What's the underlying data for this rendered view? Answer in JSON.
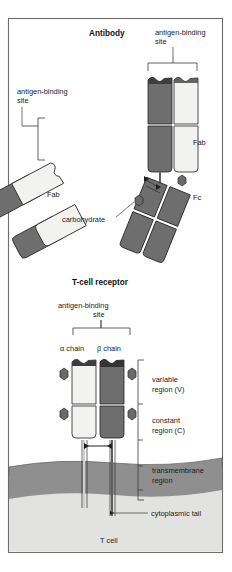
{
  "figure": {
    "title_antibody": "Antibody",
    "title_tcr": "T-cell receptor",
    "labels": {
      "antigen_binding_site_top": "antigen-binding",
      "antigen_binding_site_top2": "site",
      "antigen_binding_site_left": "antigen-binding",
      "antigen_binding_site_left2": "site",
      "antigen_binding_site_tcr": "antigen-binding",
      "antigen_binding_site_tcr2": "site",
      "fab_right": "Fab",
      "fab_left": "Fab",
      "fc": "Fc",
      "carbohydrate": "carbohydrate",
      "alpha_chain": "α chain",
      "beta_chain": "β chain",
      "variable_region": "variable",
      "variable_region2": "region (V)",
      "constant_region": "constant",
      "constant_region2": "region (C)",
      "transmembrane": "transmembrane",
      "transmembrane2": "region",
      "cytoplasmic_tail": "cytoplasmic tail",
      "t_cell": "T cell"
    },
    "colors": {
      "heavy_chain": "#6e6e6e",
      "light_chain": "#f2f2f0",
      "carbohydrate_bead": "#6a6a6a",
      "membrane": "#8f8f8f",
      "cytoplasm": "#e2e2e0",
      "outline": "#232323",
      "frame": "#6d6d6d",
      "background": "#ffffff"
    },
    "structures": {
      "antibody_parts": [
        "Fab",
        "Fab",
        "Fc"
      ],
      "tcr_chains": [
        "α chain",
        "β chain"
      ],
      "domains_per_chain": [
        "variable region (V)",
        "constant region (C)"
      ]
    }
  }
}
